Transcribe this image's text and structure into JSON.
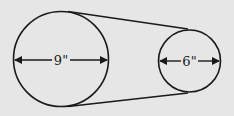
{
  "diagram": {
    "large_circle": {
      "diameter_label": "9\""
    },
    "small_circle": {
      "diameter_label": "6\""
    },
    "colors": {
      "background": "#e6e6e6",
      "stroke": "#1a1a1a"
    }
  }
}
